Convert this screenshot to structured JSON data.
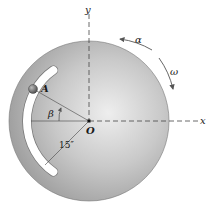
{
  "figure": {
    "type": "rotating-disk-with-curved-slot",
    "labels": {
      "y_axis": "y",
      "x_axis": "x",
      "origin": "O",
      "point": "A",
      "angle": "β",
      "radius": "15″",
      "angular_acceleration": "α",
      "angular_velocity": "ω"
    },
    "colors": {
      "disk_light": "#e6e6e6",
      "disk_dark": "#8c8c8c",
      "slot": "#ffffff",
      "ball": "#6e6e6e",
      "lines": "#333333"
    }
  }
}
